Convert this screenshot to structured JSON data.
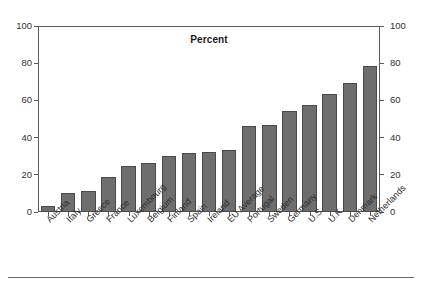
{
  "chart_data": {
    "type": "bar",
    "title": "Percent",
    "xlabel": "",
    "ylabel": "",
    "ylim": [
      0,
      100
    ],
    "yticks": [
      0,
      20,
      40,
      60,
      80,
      100
    ],
    "grid": false,
    "legend": null,
    "dual_axis": true,
    "right_axis_ticks": [
      0,
      20,
      40,
      60,
      80,
      100
    ],
    "bar_color": "#6e6e6e",
    "categories": [
      "Austria",
      "Italy",
      "Greece",
      "France",
      "Luxembourg",
      "Belgium",
      "Finland",
      "Spain",
      "Ireland",
      "EU Average",
      "Portugal",
      "Sweden",
      "Germany",
      "U.S.",
      "U.K.",
      "Denmark",
      "Netherlands"
    ],
    "values": [
      3,
      10,
      11.5,
      19,
      25,
      26.5,
      30,
      31.5,
      32.5,
      33.5,
      46.5,
      47,
      54.5,
      57.5,
      63.5,
      69.5,
      78.5
    ]
  }
}
